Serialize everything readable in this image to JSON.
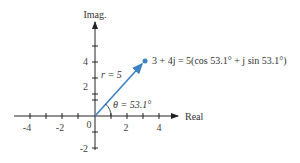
{
  "diagram": {
    "type": "complex-plane-phasor",
    "axes": {
      "x_label": "Real",
      "y_label": "Imag.",
      "x_ticks": [
        "-4",
        "-2",
        "0",
        "2",
        "4"
      ],
      "y_ticks": [
        "4",
        "2",
        "-2"
      ],
      "origin_label": "0"
    },
    "vector": {
      "from": [
        0,
        0
      ],
      "to": [
        3,
        4
      ],
      "color": "#3b82c4",
      "magnitude_label": "r = 5",
      "angle_label": "θ = 53.1°",
      "point_label": "3 + 4j = 5(cos 53.1° + j sin 53.1°)"
    }
  }
}
